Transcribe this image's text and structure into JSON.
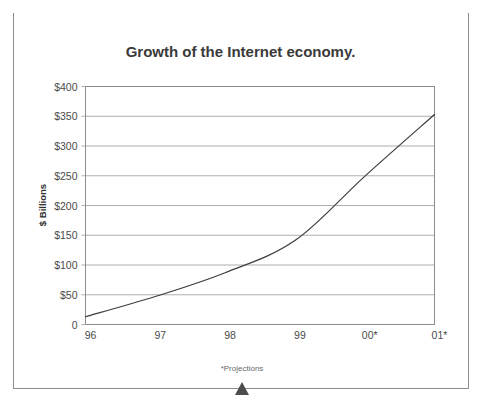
{
  "figure": {
    "header_label": "FIGURE 15-5",
    "title": "Growth of the Internet economy.",
    "footnote": "*Projections"
  },
  "colors": {
    "header_bg": "#1c1c1c",
    "header_text": "#ffffff",
    "title_text": "#3a3a3a",
    "frame": "#8d8d8d",
    "gridline": "#9a9a9a",
    "series_line": "#3d3d3d",
    "tick_text": "#4a4a4a",
    "marker": "#4d4d4d"
  },
  "chart_data": {
    "type": "line",
    "title": "Growth of the Internet economy.",
    "xlabel": "",
    "ylabel": "$ Billions",
    "categories": [
      "96",
      "97",
      "98",
      "99",
      "00*",
      "01*"
    ],
    "x_tick_labels": [
      "96",
      "97",
      "98",
      "99",
      "00*",
      "01*"
    ],
    "y_tick_labels": [
      "0",
      "$50",
      "$100",
      "$150",
      "$200",
      "$250",
      "$300",
      "$350",
      "$400"
    ],
    "y_tick_values": [
      0,
      50,
      100,
      150,
      200,
      250,
      300,
      350,
      400
    ],
    "ylim": [
      0,
      400
    ],
    "grid": true,
    "legend": "none",
    "annotations": [
      "*Projections"
    ],
    "series": [
      {
        "name": "Internet economy",
        "values": [
          13,
          47,
          87,
          141,
          249,
          353
        ]
      }
    ]
  }
}
